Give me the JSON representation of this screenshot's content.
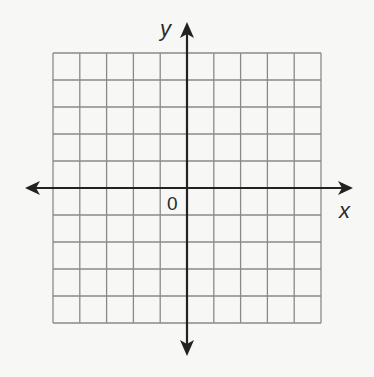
{
  "diagram": {
    "type": "coordinate-grid",
    "grid": {
      "columns": 10,
      "rows": 10,
      "x_range": [
        -5,
        5
      ],
      "y_range": [
        -5,
        5
      ],
      "line_color": "#8a8a8a"
    },
    "axes": {
      "x_label": "x",
      "y_label": "y",
      "origin_label": "0",
      "color": "#222222",
      "arrows": "both-ends"
    },
    "background": "#f7f7f5"
  }
}
